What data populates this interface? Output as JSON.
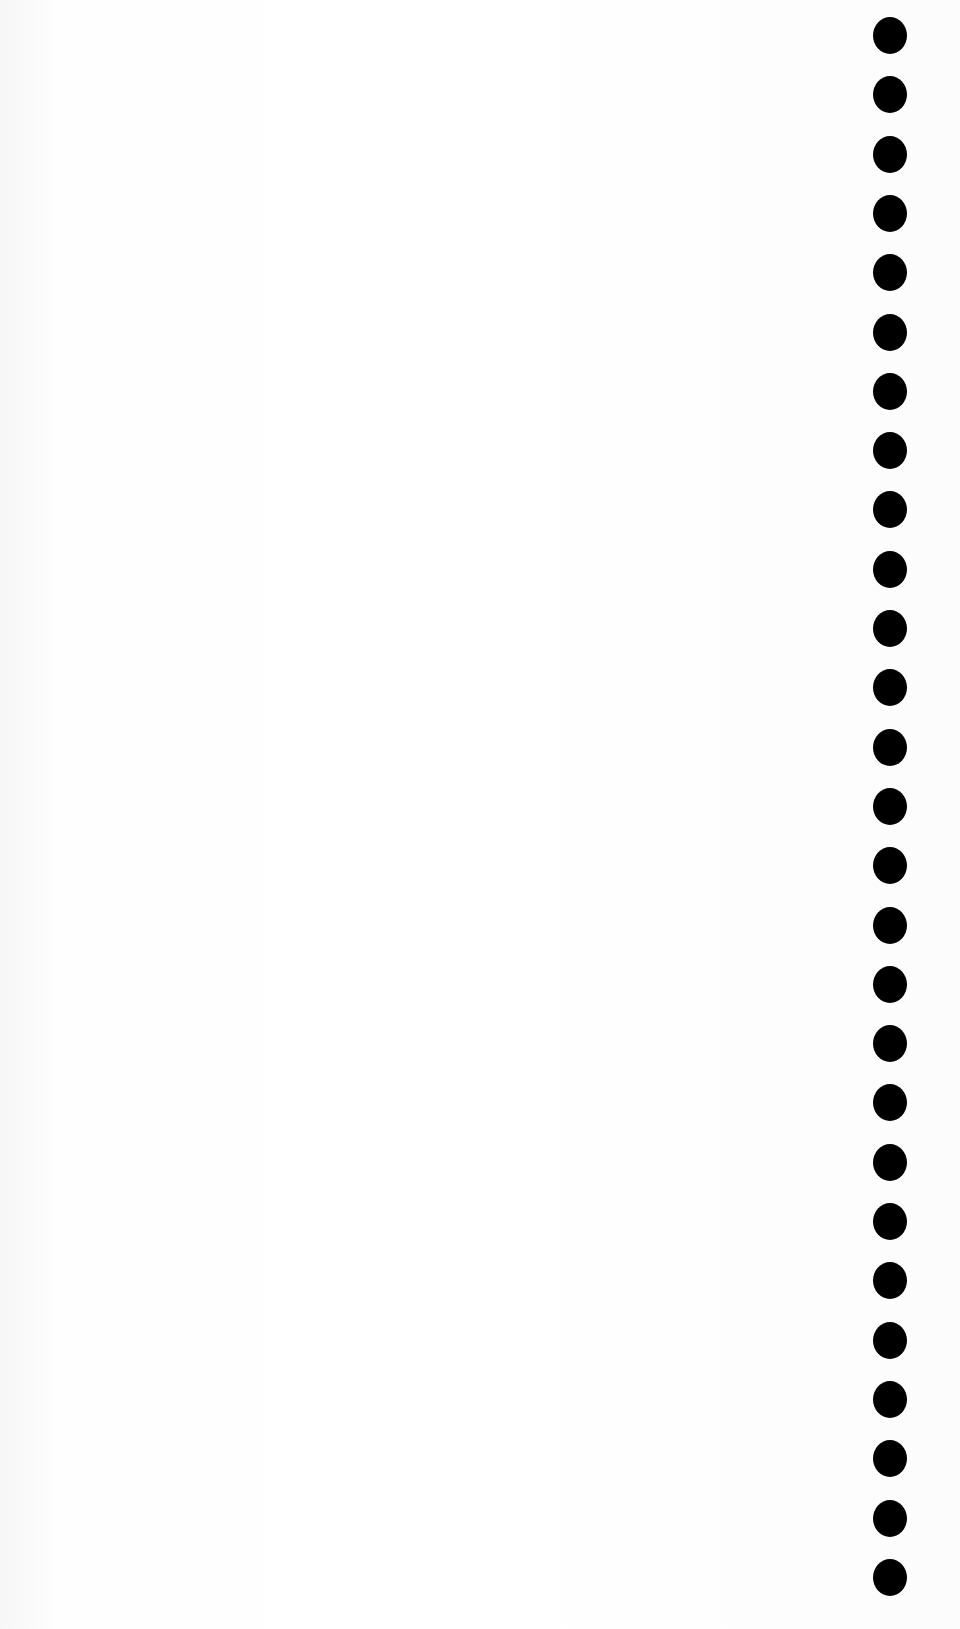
{
  "page": {
    "type": "blank scanned sheet",
    "background_color": "#fdfdfd",
    "hole_color": "#000000"
  },
  "punch_holes": {
    "count": 27,
    "first_top_px": 17,
    "spacing_px": 59.3
  }
}
